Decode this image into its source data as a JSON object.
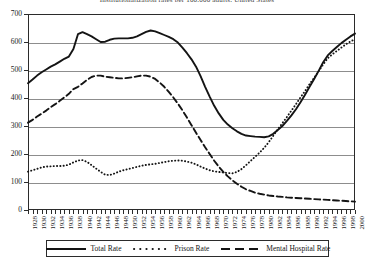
{
  "chart_data": {
    "type": "line",
    "title": "Institutionalization rates per 100,000 adults, United States",
    "xlabel": "",
    "ylabel": "",
    "xlim": [
      1928,
      2000
    ],
    "ylim": [
      0,
      700
    ],
    "grid": true,
    "legend_position": "bottom",
    "y_ticks": [
      0,
      100,
      200,
      300,
      400,
      500,
      600,
      700
    ],
    "y_tick_labels": [
      "0",
      "100",
      "200",
      "300",
      "400",
      "500",
      "600",
      "700"
    ],
    "x_tick_labels": [
      "1928",
      "1930",
      "1932",
      "1934",
      "1936",
      "1938",
      "1940",
      "1942",
      "1944",
      "1946",
      "1948",
      "1950",
      "1952",
      "1954",
      "1956",
      "1958",
      "1960",
      "1962",
      "1964",
      "1966",
      "1968",
      "1970",
      "1972",
      "1974",
      "1976",
      "1978",
      "1980",
      "1982",
      "1984",
      "1986",
      "1988",
      "1990",
      "1992",
      "1994",
      "1996",
      "1998",
      "2000"
    ],
    "x_tick_label_step": 2,
    "x": [
      1928,
      1929,
      1930,
      1931,
      1932,
      1933,
      1934,
      1935,
      1936,
      1937,
      1938,
      1939,
      1940,
      1941,
      1942,
      1943,
      1944,
      1945,
      1946,
      1947,
      1948,
      1949,
      1950,
      1951,
      1952,
      1953,
      1954,
      1955,
      1956,
      1957,
      1958,
      1959,
      1960,
      1961,
      1962,
      1963,
      1964,
      1965,
      1966,
      1967,
      1968,
      1969,
      1970,
      1971,
      1972,
      1973,
      1974,
      1975,
      1976,
      1977,
      1978,
      1979,
      1980,
      1981,
      1982,
      1983,
      1984,
      1985,
      1986,
      1987,
      1988,
      1989,
      1990,
      1991,
      1992,
      1993,
      1994,
      1995,
      1996,
      1997,
      1998,
      1999,
      2000
    ],
    "series": [
      {
        "name": "Total Rate",
        "style": "solid",
        "color": "#141414",
        "values": [
          453,
          466,
          480,
          492,
          502,
          512,
          520,
          530,
          540,
          548,
          575,
          628,
          635,
          628,
          620,
          610,
          600,
          601,
          608,
          612,
          613,
          613,
          613,
          615,
          620,
          628,
          636,
          641,
          638,
          632,
          625,
          618,
          610,
          598,
          580,
          560,
          538,
          512,
          478,
          440,
          405,
          372,
          345,
          322,
          305,
          292,
          281,
          272,
          266,
          264,
          262,
          261,
          260,
          263,
          272,
          286,
          300,
          318,
          338,
          360,
          385,
          412,
          440,
          468,
          497,
          528,
          552,
          568,
          582,
          596,
          608,
          620,
          630
        ]
      },
      {
        "name": "Prison Rate",
        "style": "dotted",
        "color": "#141414",
        "values": [
          137,
          142,
          147,
          152,
          155,
          156,
          157,
          157,
          158,
          162,
          170,
          177,
          178,
          172,
          160,
          148,
          136,
          126,
          125,
          130,
          137,
          142,
          146,
          150,
          154,
          158,
          161,
          163,
          165,
          168,
          171,
          174,
          176,
          177,
          176,
          173,
          169,
          163,
          155,
          148,
          142,
          138,
          136,
          134,
          132,
          131,
          136,
          146,
          160,
          175,
          190,
          205,
          222,
          242,
          265,
          288,
          310,
          332,
          355,
          378,
          402,
          425,
          450,
          472,
          496,
          520,
          542,
          556,
          568,
          580,
          592,
          602,
          610
        ]
      },
      {
        "name": "Mental Hospital Rate",
        "style": "dashed",
        "color": "#141414",
        "values": [
          312,
          322,
          334,
          344,
          355,
          367,
          378,
          390,
          402,
          415,
          432,
          440,
          452,
          465,
          475,
          480,
          480,
          476,
          474,
          472,
          470,
          470,
          472,
          474,
          477,
          480,
          480,
          476,
          468,
          455,
          440,
          422,
          402,
          380,
          356,
          330,
          303,
          276,
          250,
          224,
          200,
          176,
          155,
          136,
          120,
          106,
          94,
          83,
          74,
          68,
          62,
          58,
          55,
          52,
          50,
          48,
          47,
          45,
          44,
          43,
          42,
          41,
          40,
          39,
          38,
          37,
          36,
          35,
          34,
          33,
          32,
          31,
          30
        ]
      }
    ]
  },
  "legend": {
    "items": [
      {
        "label": "Total Rate",
        "style": "solid"
      },
      {
        "label": "Prison Rate",
        "style": "dotted"
      },
      {
        "label": "Mental Hospital Rate",
        "style": "dashed"
      }
    ]
  }
}
